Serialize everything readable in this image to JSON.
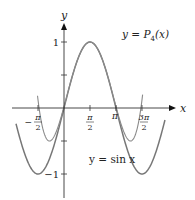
{
  "chart_data": {
    "type": "line",
    "title": "",
    "xlabel": "x",
    "ylabel": "y",
    "xlim": [
      -2.9,
      6.2
    ],
    "ylim": [
      -1.15,
      1.6
    ],
    "grid": false,
    "x_ticks": [
      {
        "value": -1.5708,
        "num": "π",
        "den": "2",
        "sign": "−"
      },
      {
        "value": 1.5708,
        "num": "π",
        "den": "2",
        "sign": ""
      },
      {
        "value": 3.14159,
        "label": "π"
      },
      {
        "value": 4.71239,
        "num": "3π",
        "den": "2",
        "sign": ""
      }
    ],
    "y_ticks": [
      {
        "value": 1,
        "label": "1"
      },
      {
        "value": 0.5,
        "label": ""
      },
      {
        "value": -0.5,
        "label": ""
      },
      {
        "value": -1,
        "label": "−1"
      }
    ],
    "series": [
      {
        "name": "y = sin x",
        "function": "sin(x)",
        "x_range": [
          -2.9,
          6.1
        ],
        "color": "#777777"
      },
      {
        "name": "y = P4(x)",
        "function": "1 - (x-π/2)^2/2 + (x-π/2)^4/24",
        "center": 1.5708,
        "x_range": [
          -1.6,
          4.75
        ],
        "color": "#8a8a8a"
      }
    ],
    "annotations": [
      {
        "text_prefix": "y = ",
        "text_main": "P",
        "text_sub": "4",
        "text_suffix": "(x)",
        "target_series": "y = P4(x)"
      },
      {
        "text": "y = sin x",
        "target_series": "y = sin x"
      }
    ]
  }
}
